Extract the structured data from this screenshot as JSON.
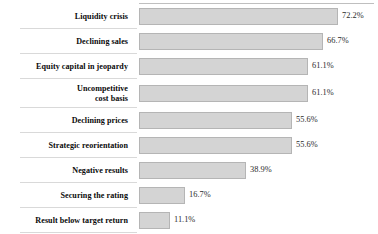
{
  "chart_data": {
    "type": "bar",
    "orientation": "horizontal",
    "title": "",
    "xlabel": "",
    "ylabel": "",
    "xlim": [
      0,
      72.2
    ],
    "grid": false,
    "legend": null,
    "value_suffix": "%",
    "categories": [
      "Liquidity crisis",
      "Declining sales",
      "Equity capital in jeopardy",
      "Uncompetitive\ncost basis",
      "Declining prices",
      "Strategic reorientation",
      "Negative results",
      "Securing the rating",
      "Result below target return"
    ],
    "values": [
      72.2,
      66.7,
      61.1,
      61.1,
      55.6,
      55.6,
      38.9,
      16.7,
      11.1
    ],
    "value_labels": [
      "72.2%",
      "66.7%",
      "61.1%",
      "61.1%",
      "55.6%",
      "55.6%",
      "38.9%",
      "16.7%",
      "11.1%"
    ],
    "bar_color": "#d4d4d4",
    "bar_border_color": "#b5b5b5",
    "separator_color": "#d9d9d9"
  },
  "rows": [
    {
      "label": "Liquidity crisis",
      "value_label": "72.2%",
      "width_px": 199,
      "height_px": 25
    },
    {
      "label": "Declining sales",
      "value_label": "66.7%",
      "width_px": 184,
      "height_px": 25
    },
    {
      "label": "Equity capital in jeopardy",
      "value_label": "61.1%",
      "width_px": 169,
      "height_px": 25
    },
    {
      "label": "Uncompetitive\ncost basis",
      "value_label": "61.1%",
      "width_px": 169,
      "height_px": 29
    },
    {
      "label": "Declining prices",
      "value_label": "55.6%",
      "width_px": 153,
      "height_px": 25
    },
    {
      "label": "Strategic reorientation",
      "value_label": "55.6%",
      "width_px": 153,
      "height_px": 25
    },
    {
      "label": "Negative results",
      "value_label": "38.9%",
      "width_px": 107,
      "height_px": 25
    },
    {
      "label": "Securing the rating",
      "value_label": "16.7%",
      "width_px": 46,
      "height_px": 25
    },
    {
      "label": "Result below target return",
      "value_label": "11.1%",
      "width_px": 31,
      "height_px": 25
    }
  ]
}
